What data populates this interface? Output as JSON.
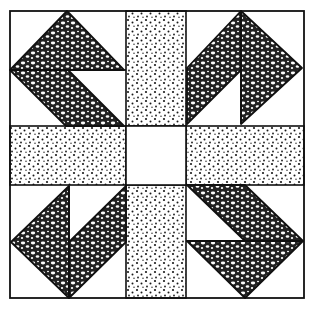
{
  "figure": {
    "colors": {
      "background": "#ffffff",
      "line": "#111111",
      "dark_fabric": "#2a2a2a",
      "dot": "#1a1a1a"
    },
    "outer_border": {
      "x1": 10,
      "y1": 11,
      "x2": 304,
      "y2": 298
    },
    "grid": {
      "col_lines": [
        10,
        126,
        186,
        304
      ],
      "row_lines": [
        11,
        126,
        185,
        298
      ]
    },
    "center_square": {
      "fabric": "plain-white"
    },
    "strips": [
      {
        "position": "top",
        "fabric": "dotted"
      },
      {
        "position": "bottom",
        "fabric": "dotted"
      },
      {
        "position": "left",
        "fabric": "dotted"
      },
      {
        "position": "right",
        "fabric": "dotted"
      }
    ],
    "corners": [
      {
        "position": "top-left",
        "shapes": [
          {
            "type": "triangle",
            "fabric": "textured-dark",
            "points": "67,11 124,70 10,70"
          },
          {
            "type": "parallelogram",
            "fabric": "textured-dark",
            "points": "10,70 68,70 124,126 66,126"
          }
        ],
        "lines": [
          "10,70 126,70"
        ]
      },
      {
        "position": "top-right",
        "shapes": [
          {
            "type": "parallelogram",
            "fabric": "textured-dark",
            "points": "241,11 241,70 187,124 187,68"
          },
          {
            "type": "triangle",
            "fabric": "textured-dark",
            "points": "241,11 302,68 241,124"
          }
        ],
        "lines": [
          "241,11 241,124"
        ]
      },
      {
        "position": "bottom-left",
        "shapes": [
          {
            "type": "triangle",
            "fabric": "textured-dark",
            "points": "69,186 11,242 69,298"
          },
          {
            "type": "parallelogram",
            "fabric": "textured-dark",
            "points": "69,242 126,186 126,242 69,298"
          }
        ],
        "lines": [
          "69,186 69,298"
        ]
      },
      {
        "position": "bottom-right",
        "shapes": [
          {
            "type": "parallelogram",
            "fabric": "textured-dark",
            "points": "187,185 245,185 303,241 245,241"
          },
          {
            "type": "triangle",
            "fabric": "textured-dark",
            "points": "187,241 303,241 245,298"
          }
        ],
        "lines": [
          "186,241 304,241"
        ]
      }
    ]
  }
}
